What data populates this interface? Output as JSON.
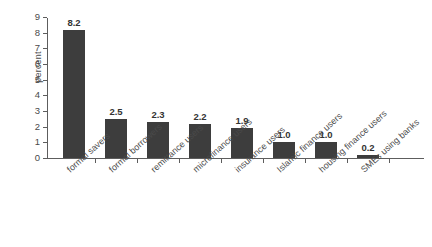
{
  "chart_data": {
    "type": "bar",
    "title": "",
    "xlabel": "",
    "ylabel": "percent",
    "ylim": [
      0,
      9
    ],
    "yticks": [
      0,
      1,
      2,
      3,
      4,
      5,
      6,
      7,
      8,
      9
    ],
    "grid": false,
    "legend": null,
    "bar_color": "#3d3d3d",
    "axis_color": "#5d5d5d",
    "background_color": "#ffffff",
    "categories": [
      "formal savers",
      "formal borrowers",
      "remittance users",
      "microfinance users",
      "insurance users",
      "Islamic finance users",
      "housing finance users",
      "SMEs using banks"
    ],
    "values": [
      8.2,
      2.5,
      2.3,
      2.2,
      1.9,
      1.0,
      1.0,
      0.2
    ],
    "value_labels": [
      "8.2",
      "2.5",
      "2.3",
      "2.2",
      "1.9",
      "1.0",
      "1.0",
      "0.2"
    ]
  }
}
